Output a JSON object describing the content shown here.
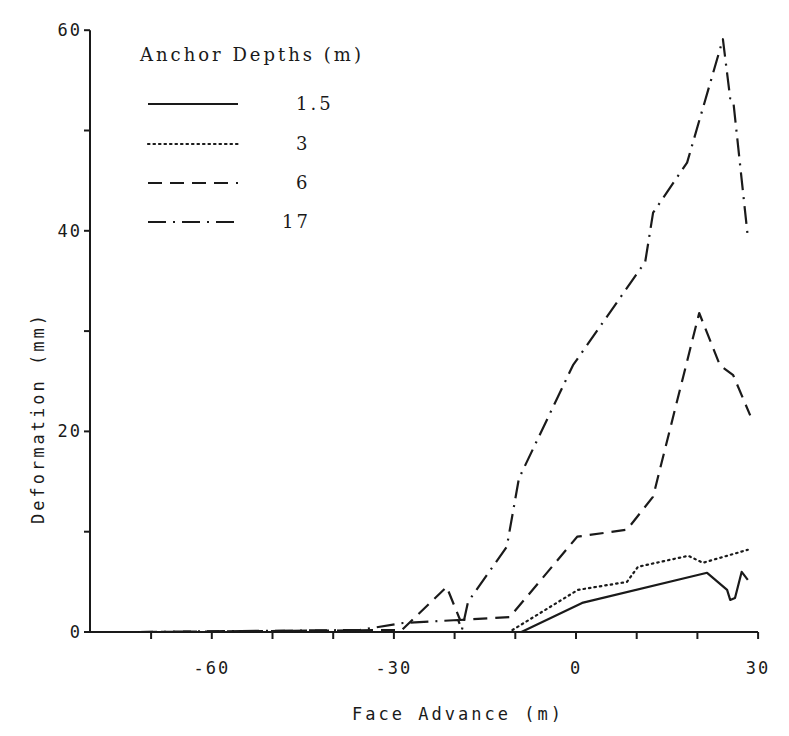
{
  "chart_data": {
    "type": "line",
    "title": "",
    "xlabel": "Face Advance (m)",
    "ylabel": "Deformation (mm)",
    "xlim": [
      -72,
      30
    ],
    "ylim": [
      0,
      60
    ],
    "x_ticks": [
      -70,
      -60,
      -50,
      -40,
      -30,
      -20,
      -10,
      0,
      10,
      20,
      30
    ],
    "x_tick_labels": [
      {
        "value": -60,
        "label": "-60"
      },
      {
        "value": -30,
        "label": "-30"
      },
      {
        "value": 0,
        "label": "0"
      },
      {
        "value": 30,
        "label": "30"
      }
    ],
    "y_ticks": [
      0,
      10,
      20,
      30,
      40,
      50,
      60
    ],
    "y_tick_labels": [
      {
        "value": 0,
        "label": "0"
      },
      {
        "value": 20,
        "label": "20"
      },
      {
        "value": 40,
        "label": "40"
      },
      {
        "value": 60,
        "label": "60"
      }
    ],
    "grid": false,
    "legend": {
      "title": "Anchor Depths (m)",
      "position": "upper-left"
    },
    "series": [
      {
        "name": "1.5",
        "style": "solid",
        "points": [
          [
            -72,
            0
          ],
          [
            -9,
            0
          ],
          [
            1,
            2.9
          ],
          [
            21.6,
            5.9
          ],
          [
            24.9,
            4.2
          ],
          [
            25.4,
            3.2
          ],
          [
            26.2,
            3.4
          ],
          [
            27.3,
            6.0
          ],
          [
            28.3,
            5.2
          ]
        ]
      },
      {
        "name": "3",
        "style": "dotted",
        "points": [
          [
            -72,
            0
          ],
          [
            -11,
            0
          ],
          [
            0.3,
            4.2
          ],
          [
            8.4,
            5.0
          ],
          [
            10.2,
            6.5
          ],
          [
            18.5,
            7.6
          ],
          [
            20.9,
            6.9
          ],
          [
            28.3,
            8.2
          ]
        ]
      },
      {
        "name": "6",
        "style": "dashed",
        "points": [
          [
            -72,
            0
          ],
          [
            -28.7,
            0.2
          ],
          [
            -21.3,
            4.5
          ],
          [
            -19.1,
            1.2
          ],
          [
            -10.9,
            1.5
          ],
          [
            0.2,
            9.5
          ],
          [
            8.4,
            10.2
          ],
          [
            12.7,
            13.5
          ],
          [
            20.3,
            31.8
          ],
          [
            23.7,
            26.6
          ],
          [
            25.9,
            25.6
          ],
          [
            28.7,
            21.6
          ]
        ]
      },
      {
        "name": "17",
        "style": "dash-dot",
        "points": [
          [
            -72,
            0
          ],
          [
            -35.6,
            0.2
          ],
          [
            -28.5,
            0.9
          ],
          [
            -19.4,
            1.2
          ],
          [
            -18.8,
            0.2
          ],
          [
            -17.8,
            3.0
          ],
          [
            -11.4,
            8.5
          ],
          [
            -9.4,
            15.3
          ],
          [
            -0.5,
            26.6
          ],
          [
            11.4,
            36.9
          ],
          [
            12.7,
            41.8
          ],
          [
            18.3,
            46.8
          ],
          [
            24.2,
            59.1
          ],
          [
            25.4,
            53.2
          ],
          [
            25.9,
            53.0
          ],
          [
            28.3,
            39.4
          ]
        ]
      }
    ]
  },
  "plot_area": {
    "x0_px": 576,
    "x_px_per_unit": 6.07,
    "y0_px": 632,
    "y_px_per_unit": 10.03,
    "y_axis_px": 90,
    "x_axis_end_px": 758
  }
}
